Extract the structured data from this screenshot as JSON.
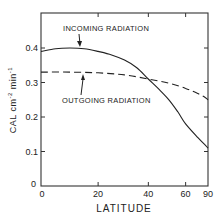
{
  "chart_data": {
    "type": "line",
    "title": "",
    "xlabel": "LATITUDE",
    "ylabel": "CAL cm-2 min-1",
    "ylabel_parts": {
      "main": "CAL  cm",
      "sup1": "-2",
      "mid": " min",
      "sup2": "-1"
    },
    "x_scale": "sine of latitude",
    "xlim": [
      0,
      90
    ],
    "ylim": [
      0,
      0.5
    ],
    "x_ticks": [
      0,
      20,
      40,
      60,
      90
    ],
    "x_tick_labels": [
      "0",
      "20",
      "40",
      "60",
      "90"
    ],
    "y_ticks": [
      0,
      0.1,
      0.2,
      0.3,
      0.4
    ],
    "y_tick_labels": [
      "0",
      "0.1",
      "0.2",
      "0.3",
      "0.4"
    ],
    "grid": false,
    "legend": "none (inline annotations with arrows)",
    "series": [
      {
        "name": "INCOMING RADIATION",
        "style": "solid",
        "x": [
          0,
          5,
          10,
          15,
          20,
          25,
          30,
          35,
          40,
          45,
          50,
          55,
          60,
          70,
          80,
          90
        ],
        "values": [
          0.39,
          0.398,
          0.4,
          0.398,
          0.39,
          0.38,
          0.365,
          0.343,
          0.31,
          0.28,
          0.25,
          0.215,
          0.18,
          0.14,
          0.118,
          0.11
        ]
      },
      {
        "name": "OUTGOING RADIATION",
        "style": "dashed",
        "x": [
          0,
          10,
          20,
          30,
          40,
          50,
          60,
          70,
          80,
          90
        ],
        "values": [
          0.33,
          0.33,
          0.328,
          0.322,
          0.31,
          0.298,
          0.283,
          0.268,
          0.256,
          0.25
        ]
      }
    ],
    "annotations": [
      {
        "text": "INCOMING RADIATION",
        "points_to_lat": 15,
        "series": "INCOMING RADIATION"
      },
      {
        "text": "OUTGOING RADIATION",
        "points_to_lat": 17,
        "series": "OUTGOING RADIATION"
      }
    ],
    "zero_label": "0"
  }
}
